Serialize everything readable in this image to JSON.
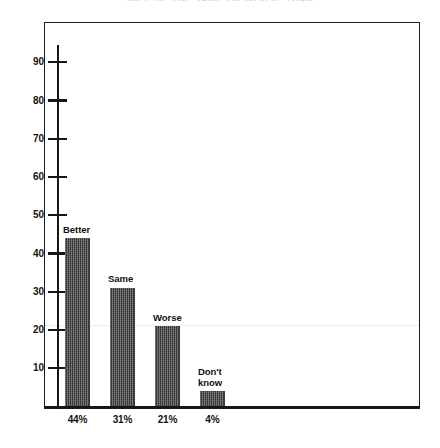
{
  "chart_data": {
    "type": "bar",
    "title": "WILL BE THE SAME OR WORSE THAN",
    "xlabel": "",
    "ylabel": "",
    "ylim": [
      0,
      95
    ],
    "grid": false,
    "legend": "none",
    "categories": [
      "Better",
      "Same",
      "Worse",
      "Don't know"
    ],
    "values": [
      44,
      31,
      21,
      4
    ],
    "bar_top_labels": [
      "Better",
      "Same",
      "Worse",
      "Don't\nknow"
    ],
    "tick_labels_x": [
      "44%",
      "31%",
      "21%",
      "4%"
    ],
    "y_ticks": [
      10,
      20,
      30,
      40,
      50,
      60,
      70,
      80,
      90
    ],
    "y_tick_labels": [
      "10",
      "20",
      "30",
      "40",
      "50",
      "60",
      "70",
      "80",
      "90"
    ],
    "series": [
      {
        "name": "Response share",
        "values": [
          44,
          31,
          21,
          4
        ]
      }
    ],
    "annotations": [],
    "colors": {
      "bar_fill": "#59595c",
      "axis": "#161616",
      "frame": "#1b1b1b",
      "text": "#131313",
      "gridline_artifact": "#ededf0",
      "background": "#ffffff"
    }
  },
  "bars": [
    {
      "label": "Better",
      "value": 44,
      "pct_label": "44%",
      "label_line1": "Better",
      "label_line2": ""
    },
    {
      "label": "Same",
      "value": 31,
      "pct_label": "31%",
      "label_line1": "Same",
      "label_line2": ""
    },
    {
      "label": "Worse",
      "value": 21,
      "pct_label": "21%",
      "label_line1": "Worse",
      "label_line2": ""
    },
    {
      "label": "Don't know",
      "value": 4,
      "pct_label": "4%",
      "label_line1": "Don't",
      "label_line2": "know"
    }
  ],
  "axis": {
    "y_labels": [
      "90",
      "80",
      "70",
      "60",
      "50",
      "40",
      "30",
      "20",
      "10"
    ]
  }
}
